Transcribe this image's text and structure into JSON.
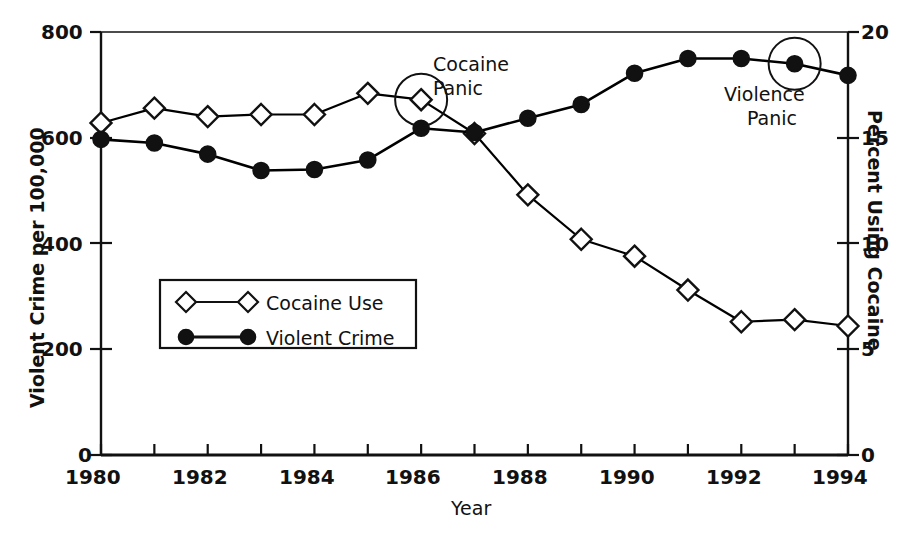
{
  "chart_data": {
    "type": "line",
    "title": "",
    "xlabel": "Year",
    "ylabel": "Violent Crime per 100,000",
    "y2label": "Percent Using Cocaine",
    "x": [
      1980,
      1981,
      1982,
      1983,
      1984,
      1985,
      1986,
      1987,
      1988,
      1989,
      1990,
      1991,
      1992,
      1993,
      1994
    ],
    "xlim": [
      1980,
      1994
    ],
    "ylim": [
      0,
      800
    ],
    "y2lim": [
      0,
      20
    ],
    "xticks": [
      1980,
      1981,
      1982,
      1983,
      1984,
      1985,
      1986,
      1987,
      1988,
      1989,
      1990,
      1991,
      1992,
      1993,
      1994
    ],
    "xticklabels": [
      "1980",
      "",
      "1982",
      "",
      "1984",
      "",
      "1986",
      "",
      "1988",
      "",
      "1990",
      "",
      "1992",
      "",
      "1994"
    ],
    "yticks": [
      0,
      200,
      400,
      600,
      800
    ],
    "yticklabels": [
      "0",
      "200",
      "400",
      "600",
      "800"
    ],
    "y2ticks": [
      0,
      5,
      10,
      15,
      20
    ],
    "y2ticklabels": [
      "0",
      "5",
      "10",
      "15",
      "20"
    ],
    "grid": false,
    "legend_position": "center-left-inside",
    "series": [
      {
        "name": "Cocaine Use",
        "axis": "right",
        "marker": "open-diamond",
        "color": "#000000",
        "values": [
          15.7,
          16.4,
          16.0,
          16.1,
          16.1,
          17.1,
          16.8,
          15.2,
          12.3,
          10.2,
          9.4,
          7.8,
          6.3,
          6.4,
          6.1
        ]
      },
      {
        "name": "Violent Crime",
        "axis": "left",
        "marker": "filled-circle",
        "color": "#000000",
        "values": [
          597,
          590,
          569,
          538,
          540,
          558,
          618,
          610,
          637,
          663,
          722,
          750,
          750,
          740,
          718
        ]
      }
    ],
    "annotations": [
      {
        "id": "cocaine-panic",
        "text_line1": "Cocaine",
        "text_line2": "Panic",
        "series": "Cocaine Use",
        "x": 1986,
        "y": 16.8,
        "marker_highlight": "circle"
      },
      {
        "id": "violence-panic",
        "text_line1": "Violence",
        "text_line2": "Panic",
        "series": "Violent Crime",
        "x": 1993,
        "y": 740,
        "marker_highlight": "circle"
      }
    ],
    "legend": {
      "entries": [
        {
          "label": "Cocaine Use",
          "marker": "open-diamond"
        },
        {
          "label": "Violent Crime",
          "marker": "filled-circle"
        }
      ]
    }
  },
  "axes": {
    "left_title": "Violent Crime per 100,000",
    "right_title": "Percent Using Cocaine",
    "x_title": "Year",
    "left_ticks": [
      "800",
      "600",
      "400",
      "200",
      "0"
    ],
    "right_ticks": [
      "20",
      "15",
      "10",
      "5",
      "0"
    ],
    "x_ticks": [
      "1980",
      "1982",
      "1984",
      "1986",
      "1988",
      "1990",
      "1992",
      "1994"
    ]
  },
  "annotations": {
    "cocaine_panic_line1": "Cocaine",
    "cocaine_panic_line2": "Panic",
    "violence_panic_line1": "Violence",
    "violence_panic_line2": "Panic"
  },
  "legend": {
    "cocaine_use": "Cocaine Use",
    "violent_crime": "Violent Crime"
  }
}
